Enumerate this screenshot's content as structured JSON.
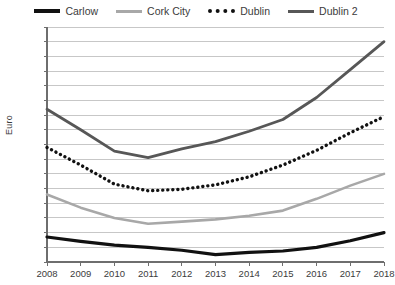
{
  "chart_data": {
    "type": "line",
    "title": "",
    "xlabel": "",
    "ylabel": "Euro",
    "x": [
      2008,
      2009,
      2010,
      2011,
      2012,
      2013,
      2014,
      2015,
      2016,
      2017,
      2018
    ],
    "categories": [
      "2008",
      "2009",
      "2010",
      "2011",
      "2012",
      "2013",
      "2014",
      "2015",
      "2016",
      "2017",
      "2018"
    ],
    "ylim": [
      500,
      2100
    ],
    "ytick_step": 100,
    "yticks": [
      2100,
      2000,
      1900,
      1800,
      1700,
      1600,
      1500,
      1400,
      1300,
      1200,
      1100,
      1000,
      900,
      800,
      700,
      600,
      500
    ],
    "ytick_labels": [
      "2,100",
      "2,000",
      "1,900",
      "1,800",
      "1,700",
      "1,600",
      "1,500",
      "1,400",
      "1,300",
      "1,200",
      "1,100",
      "1,000",
      "900",
      "800",
      "700",
      "600",
      "500"
    ],
    "grid": true,
    "legend_position": "top",
    "series": [
      {
        "name": "Carlow",
        "color": "#111111",
        "style": "solid",
        "width": 3.2,
        "values": [
          670,
          640,
          615,
          600,
          580,
          550,
          565,
          575,
          600,
          645,
          700
        ]
      },
      {
        "name": "Cork City",
        "color": "#a8a8a8",
        "style": "solid",
        "width": 2.6,
        "values": [
          960,
          870,
          800,
          760,
          775,
          790,
          815,
          850,
          930,
          1020,
          1100
        ]
      },
      {
        "name": "Dublin",
        "color": "#111111",
        "style": "dotted",
        "width": 3.4,
        "values": [
          1280,
          1160,
          1030,
          985,
          995,
          1025,
          1080,
          1160,
          1260,
          1380,
          1490
        ]
      },
      {
        "name": "Dublin 2",
        "color": "#575757",
        "style": "solid",
        "width": 2.8,
        "values": [
          1540,
          1400,
          1255,
          1210,
          1270,
          1320,
          1390,
          1470,
          1620,
          1810,
          2000
        ]
      }
    ]
  },
  "legend": {
    "items": [
      {
        "label": "Carlow"
      },
      {
        "label": "Cork City"
      },
      {
        "label": "Dublin"
      },
      {
        "label": "Dublin 2"
      }
    ]
  },
  "axis": {
    "y_title": "Euro"
  }
}
